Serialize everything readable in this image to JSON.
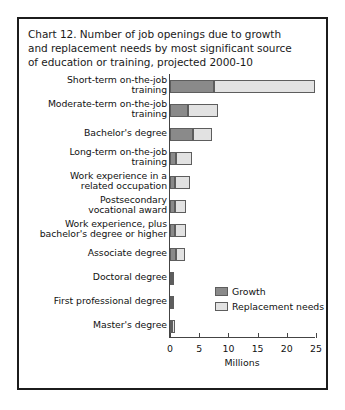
{
  "figure": {
    "title_lines": [
      "Chart 12. Number of job openings due to growth",
      "and replacement needs by most significant source",
      "of education or training, projected 2000-10"
    ],
    "border_color": "#1c1c1c",
    "background": "#ffffff"
  },
  "legend": {
    "position": "inside-right",
    "entries": [
      {
        "label": "Growth",
        "color": "#8a8a8a"
      },
      {
        "label": "Replacement needs",
        "color": "#e2e2e2"
      }
    ]
  },
  "chart_data": {
    "type": "bar",
    "orientation": "horizontal",
    "stacked": true,
    "title": "Chart 12. Number of job openings due to growth and replacement needs by most significant source of education or training, projected 2000-10",
    "xlabel": "Millions",
    "ylabel": "",
    "xlim": [
      0,
      25
    ],
    "xticks": [
      0,
      5,
      10,
      15,
      20,
      25
    ],
    "xticklabels": [
      "0",
      "5",
      "10",
      "15",
      "20",
      "25"
    ],
    "grid": false,
    "categories": [
      "Short-term on-the-job training",
      "Moderate-term on-the-job training",
      "Bachelor's degree",
      "Long-term on-the-job training",
      "Work experience in a related occupation",
      "Postsecondary vocational award",
      "Work experience, plus bachelor's degree or higher",
      "Associate degree",
      "Doctoral degree",
      "First professional degree",
      "Master's degree"
    ],
    "category_label_lines": [
      [
        "Short-term on-the-job",
        "training"
      ],
      [
        "Moderate-term on-the-job",
        "training"
      ],
      [
        "Bachelor's degree"
      ],
      [
        "Long-term on-the-job",
        "training"
      ],
      [
        "Work experience in a",
        "related occupation"
      ],
      [
        "Postsecondary",
        "vocational award"
      ],
      [
        "Work experience, plus",
        "bachelor's degree or higher"
      ],
      [
        "Associate degree"
      ],
      [
        "Doctoral degree"
      ],
      [
        "First professional degree"
      ],
      [
        "Master's degree"
      ]
    ],
    "series": [
      {
        "name": "Growth",
        "color": "#8a8a8a",
        "values": [
          7.6,
          3.1,
          4.0,
          1.0,
          0.9,
          0.9,
          0.8,
          1.1,
          0.2,
          0.2,
          0.3
        ]
      },
      {
        "name": "Replacement needs",
        "color": "#e2e2e2",
        "values": [
          17.3,
          5.2,
          3.2,
          2.7,
          2.6,
          1.8,
          2.0,
          1.4,
          0.3,
          0.3,
          0.5
        ]
      }
    ],
    "totals": [
      24.9,
      8.3,
      7.2,
      3.7,
      3.5,
      2.7,
      2.8,
      2.5,
      0.5,
      0.5,
      0.8
    ],
    "units": "Millions"
  }
}
